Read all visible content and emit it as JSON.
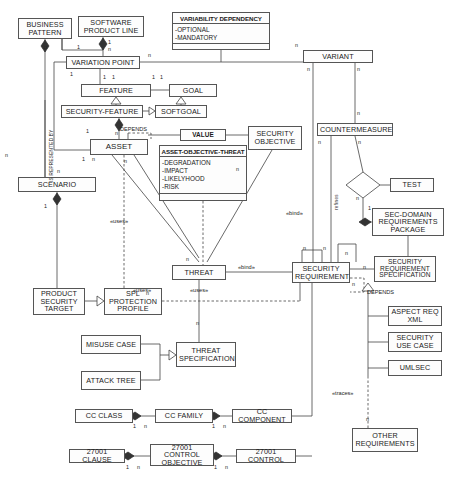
{
  "diagram": {
    "type": "uml-class-diagram",
    "canvas": {
      "width": 463,
      "height": 486
    },
    "colors": {
      "stroke": "#444444",
      "fill": "#fdfdfd",
      "text": "#1a1a1a",
      "background": "#ffffff"
    }
  },
  "nodes": [
    {
      "id": "business_pattern",
      "label": "BUSINESS PATTERN",
      "x": 18,
      "y": 18,
      "w": 54,
      "h": 21
    },
    {
      "id": "software_product_line",
      "label": "SOFTWARE PRODUCT LINE",
      "x": 78,
      "y": 16,
      "w": 66,
      "h": 21
    },
    {
      "id": "variation_point",
      "label": "VARIATION POINT",
      "x": 66,
      "y": 56,
      "w": 74,
      "h": 13
    },
    {
      "id": "feature",
      "label": "FEATURE",
      "x": 81,
      "y": 84,
      "w": 70,
      "h": 13
    },
    {
      "id": "goal",
      "label": "GOAL",
      "x": 169,
      "y": 84,
      "w": 48,
      "h": 13
    },
    {
      "id": "security_feature",
      "label": "SECURITY-FEATURE",
      "x": 61,
      "y": 105,
      "w": 82,
      "h": 13
    },
    {
      "id": "softgoal",
      "label": "SOFTGOAL",
      "x": 155,
      "y": 105,
      "w": 52,
      "h": 13
    },
    {
      "id": "asset",
      "label": "ASSET",
      "x": 90,
      "y": 139,
      "w": 58,
      "h": 16
    },
    {
      "id": "value",
      "label": "VALUE",
      "x": 180,
      "y": 129,
      "w": 46,
      "h": 12
    },
    {
      "id": "security_objective",
      "label": "SECURITY OBJECTIVE",
      "x": 248,
      "y": 126,
      "w": 54,
      "h": 24
    },
    {
      "id": "scenario",
      "label": "SCENARIO",
      "x": 18,
      "y": 177,
      "w": 78,
      "h": 15
    },
    {
      "id": "variant",
      "label": "VARIANT",
      "x": 303,
      "y": 50,
      "w": 70,
      "h": 13
    },
    {
      "id": "countermeasure",
      "label": "COUNTERMEASURE",
      "x": 317,
      "y": 123,
      "w": 76,
      "h": 13
    },
    {
      "id": "test",
      "label": "TEST",
      "x": 390,
      "y": 178,
      "w": 44,
      "h": 14
    },
    {
      "id": "sec_domain_req_package",
      "label": "SEC-DOMAIN REQUIREMENTS PACKAGE",
      "x": 372,
      "y": 208,
      "w": 72,
      "h": 28
    },
    {
      "id": "threat",
      "label": "THREAT",
      "x": 172,
      "y": 265,
      "w": 54,
      "h": 15
    },
    {
      "id": "security_requirement",
      "label": "SECURITY REQUIREMENT",
      "x": 292,
      "y": 262,
      "w": 58,
      "h": 21
    },
    {
      "id": "security_req_spec",
      "label": "SECURITY REQUIREMENT SPECIFICATION",
      "x": 374,
      "y": 256,
      "w": 62,
      "h": 26
    },
    {
      "id": "product_security_target",
      "label": "PRODUCT SECURITY TARGET",
      "x": 33,
      "y": 288,
      "w": 52,
      "h": 27
    },
    {
      "id": "spl_protection_profile",
      "label": "SPL PROTECTION PROFILE",
      "x": 104,
      "y": 288,
      "w": 58,
      "h": 27
    },
    {
      "id": "misuse_case",
      "label": "MISUSE CASE",
      "x": 81,
      "y": 335,
      "w": 60,
      "h": 19
    },
    {
      "id": "attack_tree",
      "label": "ATTACK TREE",
      "x": 81,
      "y": 371,
      "w": 60,
      "h": 19
    },
    {
      "id": "threat_specification",
      "label": "THREAT SPECIFICATION",
      "x": 176,
      "y": 342,
      "w": 60,
      "h": 25
    },
    {
      "id": "aspect_req_xml",
      "label": "ASPECT REQ XML",
      "x": 388,
      "y": 306,
      "w": 54,
      "h": 20
    },
    {
      "id": "security_use_case",
      "label": "SECURITY USE CASE",
      "x": 388,
      "y": 332,
      "w": 54,
      "h": 20
    },
    {
      "id": "umlsec",
      "label": "UMLSEC",
      "x": 388,
      "y": 360,
      "w": 54,
      "h": 16
    },
    {
      "id": "other_requirements",
      "label": "OTHER REQUIREMENTS",
      "x": 352,
      "y": 428,
      "w": 66,
      "h": 24
    },
    {
      "id": "cc_class",
      "label": "CC CLASS",
      "x": 75,
      "y": 409,
      "w": 58,
      "h": 14
    },
    {
      "id": "cc_family",
      "label": "CC FAMILY",
      "x": 155,
      "y": 409,
      "w": 58,
      "h": 14
    },
    {
      "id": "cc_component",
      "label": "CC COMPONENT",
      "x": 232,
      "y": 409,
      "w": 60,
      "h": 14
    },
    {
      "id": "clause_27001",
      "label": "27001 CLAUSE",
      "x": 69,
      "y": 449,
      "w": 56,
      "h": 14
    },
    {
      "id": "control_objective_27001",
      "label": "27001 CONTROL OBJECTIVE",
      "x": 150,
      "y": 444,
      "w": 64,
      "h": 22
    },
    {
      "id": "control_27001",
      "label": "27001 CONTROL",
      "x": 236,
      "y": 449,
      "w": 60,
      "h": 14
    }
  ],
  "class_boxes": [
    {
      "id": "variability_dependency",
      "title": "VARIABILITY DEPENDENCY",
      "attributes": [
        "-OPTIONAL",
        "-MANDATORY"
      ],
      "x": 172,
      "y": 12,
      "w": 98,
      "h": 38
    },
    {
      "id": "asset_objective_threat",
      "title": "ASSET-OBJECTIVE-THREAT",
      "attributes": [
        "-DEGRADATION",
        "-IMPACT",
        "-LIKELYHOOD",
        "-RISK"
      ],
      "x": 159,
      "y": 145,
      "w": 88,
      "h": 56
    }
  ],
  "edge_labels": [
    {
      "id": "depends_asset",
      "text": "DEPENDS",
      "x": 120,
      "y": 126
    },
    {
      "id": "depends_secreq",
      "text": "DEPENDS",
      "x": 367,
      "y": 289
    },
    {
      "id": "uses_asset_threat",
      "text": "«uses»",
      "x": 117,
      "y": 218
    },
    {
      "id": "uses_threat_left",
      "text": "«uses»",
      "x": 140,
      "y": 287
    },
    {
      "id": "uses_threat_right",
      "text": "«uses»",
      "x": 197,
      "y": 287
    },
    {
      "id": "bind_objective",
      "text": "«bind»",
      "x": 289,
      "y": 214
    },
    {
      "id": "bind_threat_req",
      "text": "«bind»",
      "x": 241,
      "y": 264
    },
    {
      "id": "traces_other_req",
      "text": "«traces»",
      "x": 337,
      "y": 392
    },
    {
      "id": "refines_label",
      "text": "refines",
      "x": 330,
      "y": 186
    },
    {
      "id": "is_represented_by",
      "text": "IS REPRESENTED BY",
      "x": 48,
      "y": 168
    }
  ],
  "multiplicities": [
    {
      "text": "n",
      "x": 44,
      "y": 44
    },
    {
      "text": "1",
      "x": 77,
      "y": 44
    },
    {
      "text": "1",
      "x": 70,
      "y": 71
    },
    {
      "text": "1",
      "x": 108,
      "y": 42
    },
    {
      "text": "n",
      "x": 108,
      "y": 48
    },
    {
      "text": "n",
      "x": 148,
      "y": 57
    },
    {
      "text": "1",
      "x": 103,
      "y": 76
    },
    {
      "text": "1",
      "x": 112,
      "y": 76
    },
    {
      "text": "1",
      "x": 152,
      "y": 76
    },
    {
      "text": "1",
      "x": 160,
      "y": 76
    },
    {
      "text": "n",
      "x": 115,
      "y": 133
    },
    {
      "text": "1",
      "x": 91,
      "y": 130
    },
    {
      "text": "1",
      "x": 86,
      "y": 155
    },
    {
      "text": "n",
      "x": 94,
      "y": 155
    },
    {
      "text": "n",
      "x": 7,
      "y": 152
    },
    {
      "text": "n",
      "x": 57,
      "y": 168
    },
    {
      "text": "1",
      "x": 44,
      "y": 203
    },
    {
      "text": "n",
      "x": 122,
      "y": 160
    },
    {
      "text": "n",
      "x": 238,
      "y": 166
    },
    {
      "text": "n",
      "x": 297,
      "y": 44
    },
    {
      "text": "n",
      "x": 313,
      "y": 66
    },
    {
      "text": "n",
      "x": 352,
      "y": 66
    },
    {
      "text": "n",
      "x": 352,
      "y": 110
    },
    {
      "text": "n",
      "x": 322,
      "y": 140
    },
    {
      "text": "n",
      "x": 355,
      "y": 140
    },
    {
      "text": "n",
      "x": 356,
      "y": 196
    },
    {
      "text": "1",
      "x": 368,
      "y": 207
    },
    {
      "text": "n",
      "x": 188,
      "y": 258
    },
    {
      "text": "n",
      "x": 305,
      "y": 247
    },
    {
      "text": "n",
      "x": 325,
      "y": 247
    },
    {
      "text": "n",
      "x": 345,
      "y": 252
    },
    {
      "text": "n",
      "x": 363,
      "y": 266
    },
    {
      "text": "n",
      "x": 352,
      "y": 283
    },
    {
      "text": "n",
      "x": 366,
      "y": 418
    },
    {
      "text": "n",
      "x": 148,
      "y": 292
    },
    {
      "text": "n",
      "x": 198,
      "y": 320
    },
    {
      "text": "1",
      "x": 135,
      "y": 424
    },
    {
      "text": "n",
      "x": 146,
      "y": 424
    },
    {
      "text": "1",
      "x": 214,
      "y": 424
    },
    {
      "text": "n",
      "x": 225,
      "y": 424
    },
    {
      "text": "1",
      "x": 128,
      "y": 465
    },
    {
      "text": "n",
      "x": 139,
      "y": 465
    },
    {
      "text": "1",
      "x": 216,
      "y": 465
    },
    {
      "text": "n",
      "x": 227,
      "y": 465
    }
  ],
  "shapes": {
    "diamond": {
      "id": "test-association-diamond",
      "cx": 363,
      "cy": 185,
      "rx": 17,
      "ry": 13
    }
  }
}
